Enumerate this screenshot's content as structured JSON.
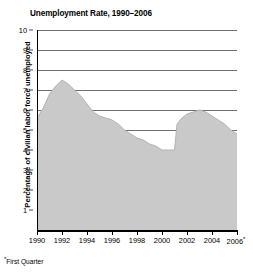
{
  "chart_data": {
    "type": "area",
    "title": "Unemployment Rate, 1990–2006",
    "xlabel": "",
    "ylabel": "Percentage of civilian labor force unemployed",
    "footnote": "*First Quarter",
    "footnote_marker": "*",
    "grid": true,
    "legend": "none",
    "fill_color": "#c9c9c9",
    "line_color": "#b0b0b0",
    "gridline_color": "#6f6f6f",
    "axis_color": "#000000",
    "xlim": [
      1990,
      2006
    ],
    "ylim": [
      0,
      10
    ],
    "y_ticks": [
      1,
      2,
      3,
      4,
      5,
      6,
      7,
      8,
      9,
      10
    ],
    "y_tick_labels": [
      "1",
      "2",
      "3",
      "4",
      "5",
      "6",
      "7",
      "8",
      "9",
      "10"
    ],
    "x_ticks": [
      1990,
      1992,
      1994,
      1996,
      1998,
      2000,
      2002,
      2004,
      2006
    ],
    "x_tick_labels": [
      "1990",
      "1992",
      "1994",
      "1996",
      "1998",
      "2000",
      "2002",
      "2004",
      "2006"
    ],
    "x_tick_label_last_marker": "*",
    "x": [
      1990,
      1990.5,
      1991,
      1991.5,
      1992,
      1992.5,
      1993,
      1993.5,
      1994,
      1994.5,
      1995,
      1995.5,
      1996,
      1996.5,
      1997,
      1997.5,
      1998,
      1998.5,
      1999,
      1999.5,
      2000,
      2000.5,
      2001,
      2001.2,
      2001.6,
      2002,
      2002.5,
      2003,
      2003.5,
      2004,
      2004.5,
      2005,
      2005.5,
      2006
    ],
    "values": [
      5.6,
      6.1,
      6.8,
      7.2,
      7.5,
      7.3,
      7.0,
      6.7,
      6.3,
      5.9,
      5.7,
      5.6,
      5.5,
      5.3,
      5.0,
      4.8,
      4.6,
      4.5,
      4.3,
      4.2,
      4.0,
      4.0,
      4.0,
      5.3,
      5.6,
      5.8,
      5.9,
      6.0,
      5.9,
      5.7,
      5.5,
      5.3,
      5.0,
      4.8
    ],
    "series": [
      {
        "name": "Unemployment rate",
        "points": [
          {
            "year": 1990,
            "value": 5.6
          },
          {
            "year": 1991,
            "value": 6.8
          },
          {
            "year": 1992,
            "value": 7.5
          },
          {
            "year": 1993,
            "value": 7.0
          },
          {
            "year": 1994,
            "value": 6.3
          },
          {
            "year": 1995,
            "value": 5.7
          },
          {
            "year": 1996,
            "value": 5.5
          },
          {
            "year": 1997,
            "value": 5.0
          },
          {
            "year": 1998,
            "value": 4.6
          },
          {
            "year": 1999,
            "value": 4.3
          },
          {
            "year": 2000,
            "value": 4.0
          },
          {
            "year": 2001,
            "value": 4.0
          },
          {
            "year": 2002,
            "value": 5.8
          },
          {
            "year": 2003,
            "value": 6.0
          },
          {
            "year": 2004,
            "value": 5.7
          },
          {
            "year": 2005,
            "value": 5.3
          },
          {
            "year": 2006,
            "value": 4.8
          }
        ]
      }
    ]
  }
}
